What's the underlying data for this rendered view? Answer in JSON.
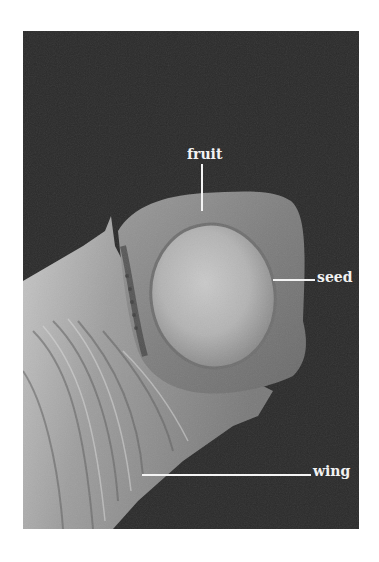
{
  "figure": {
    "background_color": "#2a2a2a",
    "labels": [
      {
        "id": "fruit",
        "text": "fruit"
      },
      {
        "id": "seed",
        "text": "seed"
      },
      {
        "id": "wing",
        "text": "wing"
      }
    ]
  }
}
